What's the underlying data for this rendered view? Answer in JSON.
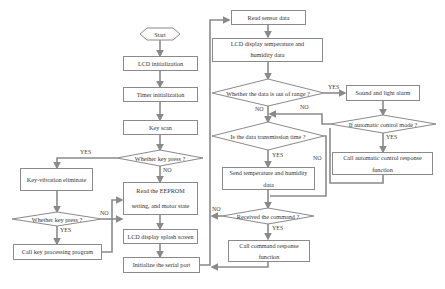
{
  "flowchart": {
    "start": "Start",
    "lcd_init": "LCD initialization",
    "timer_init": "Timer initialization",
    "key_scan": "Key scan",
    "whether_key_press_1": "Whether key press ?",
    "key_vibration": "Key-vibration eliminate",
    "whether_key_press_2": "Whether key press ?",
    "call_key_processing": "Call key processing program",
    "read_eeprom_line1": "Read the EEPROM",
    "read_eeprom_line2": "setting, and motor state",
    "lcd_splash": "LCD display splash screen",
    "init_serial": "Initialize the serial port",
    "read_sensor": "Read sensor data",
    "lcd_temp_line1": "LCD display temperature and",
    "lcd_temp_line2": "humidity data",
    "out_of_range": "Whether the data is out of range ?",
    "sound_alarm": "Sound and light alarm",
    "auto_mode": "If automatic control mode ?",
    "call_auto_line1": "Call automatic control response",
    "call_auto_line2": "function",
    "transmission_time": "Is the data transmission time ?",
    "send_data_line1": "Send temperature and humidity",
    "send_data_line2": "data",
    "received_command": "Received the command ?",
    "call_command_line1": "Call command response",
    "call_command_line2": "function"
  },
  "labels": {
    "yes": "YES",
    "no": "NO"
  },
  "colors": {
    "line": "#8a8a8a",
    "border": "#8a8a8a",
    "text": "#333333"
  }
}
